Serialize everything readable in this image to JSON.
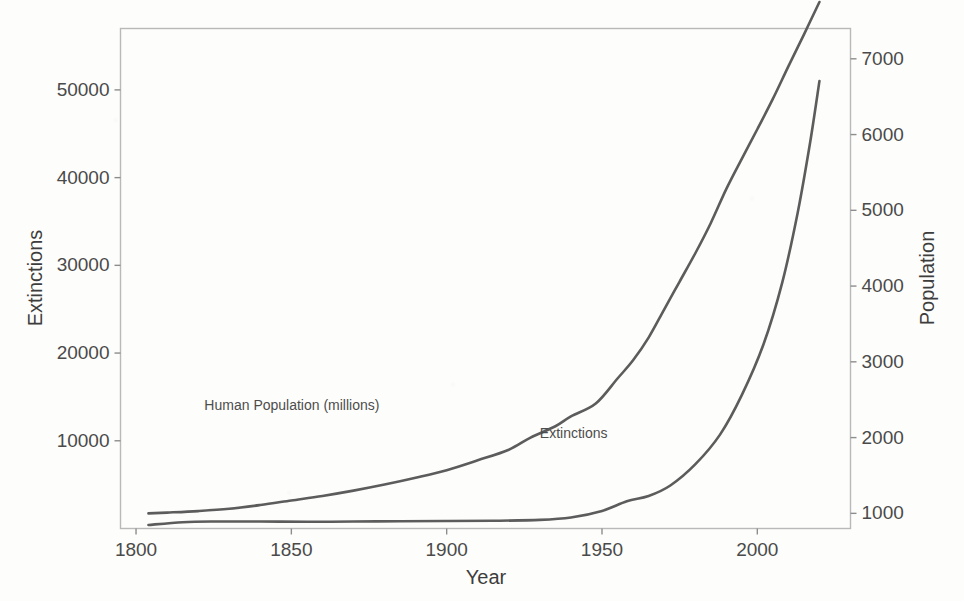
{
  "chart_data": {
    "type": "line",
    "title": "",
    "xlabel": "Year",
    "ylabel": "Extinctions",
    "y2label": "Population",
    "xlim": [
      1795,
      2030
    ],
    "ylim": [
      0,
      57000
    ],
    "y2lim": [
      800,
      7400
    ],
    "grid": false,
    "legend_position": "inline-annotations",
    "x_ticks": [
      "1800",
      "1850",
      "1900",
      "1950",
      "2000"
    ],
    "x_tick_values": [
      1800,
      1850,
      1900,
      1950,
      2000
    ],
    "y_ticks": [
      "10000",
      "20000",
      "30000",
      "40000",
      "50000"
    ],
    "y_tick_values": [
      10000,
      20000,
      30000,
      40000,
      50000
    ],
    "y2_ticks": [
      "1000",
      "2000",
      "3000",
      "4000",
      "5000",
      "6000",
      "7000"
    ],
    "y2_tick_values": [
      1000,
      2000,
      3000,
      4000,
      5000,
      6000,
      7000
    ],
    "annotations": [
      {
        "text": "Human Population (millions)",
        "x": 1822,
        "y_px": 410
      },
      {
        "text": "Extinctions",
        "x": 1930,
        "y_px": 438
      }
    ],
    "series": [
      {
        "name": "Human Population (millions)",
        "axis": "right",
        "color": "#5c5c5c",
        "x": [
          1804,
          1810,
          1820,
          1830,
          1840,
          1850,
          1860,
          1870,
          1880,
          1890,
          1900,
          1910,
          1920,
          1927,
          1935,
          1940,
          1948,
          1955,
          1960,
          1965,
          1970,
          1975,
          1980,
          1985,
          1990,
          1995,
          2000,
          2005,
          2010,
          2015,
          2020
        ],
        "values": [
          1000,
          1010,
          1030,
          1060,
          1110,
          1170,
          1230,
          1300,
          1380,
          1470,
          1570,
          1700,
          1840,
          2000,
          2150,
          2280,
          2450,
          2780,
          3020,
          3320,
          3690,
          4060,
          4430,
          4830,
          5280,
          5680,
          6070,
          6470,
          6900,
          7320,
          7750
        ]
      },
      {
        "name": "Extinctions",
        "axis": "left",
        "color": "#5c5c5c",
        "x": [
          1804,
          1815,
          1825,
          1840,
          1855,
          1870,
          1885,
          1900,
          1915,
          1930,
          1940,
          1950,
          1958,
          1965,
          1972,
          1980,
          1988,
          1995,
          2002,
          2008,
          2013,
          2017,
          2020
        ],
        "values": [
          400,
          720,
          800,
          790,
          770,
          790,
          830,
          850,
          880,
          980,
          1250,
          2000,
          3100,
          3700,
          4900,
          7300,
          10700,
          15200,
          21000,
          28000,
          36000,
          44000,
          51000
        ]
      }
    ]
  },
  "axes": {
    "left_title": "Extinctions",
    "right_title": "Population",
    "bottom_title": "Year"
  }
}
